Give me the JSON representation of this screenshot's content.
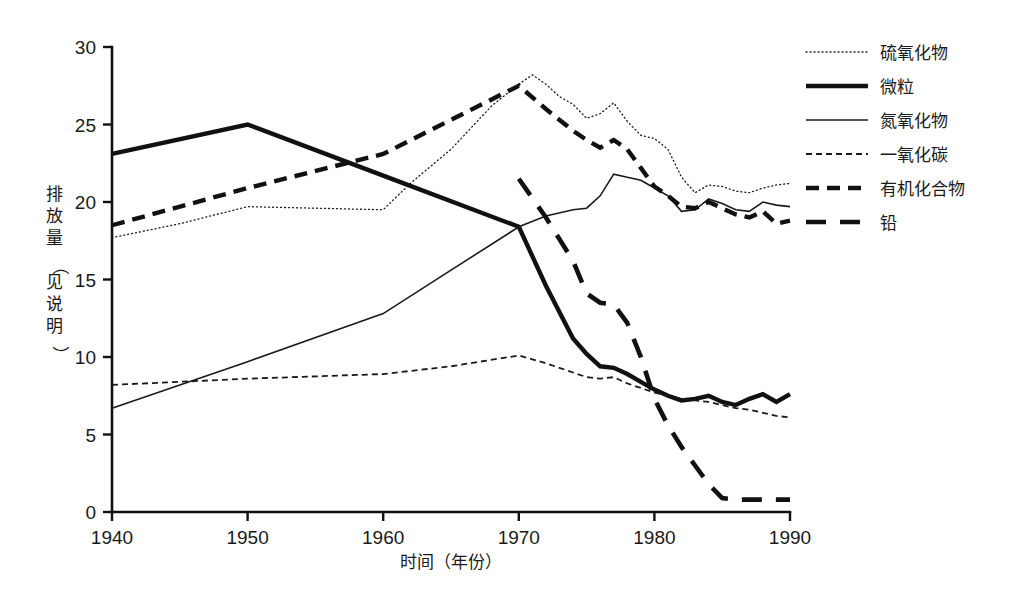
{
  "chart_data": {
    "type": "line",
    "title": "",
    "xlabel": "时间（年份）",
    "ylabel": "排放量（见说明）",
    "xlim": [
      1940,
      1990
    ],
    "ylim": [
      0,
      30
    ],
    "xticks": [
      1940,
      1950,
      1960,
      1970,
      1980,
      1990
    ],
    "xtick_labels": [
      "1940",
      "1950",
      "1960",
      "1970",
      "1980",
      "1990"
    ],
    "yticks": [
      0,
      5,
      10,
      15,
      20,
      25,
      30
    ],
    "ytick_labels": [
      "0",
      "5",
      "10",
      "15",
      "20",
      "25",
      "30"
    ],
    "grid": false,
    "legend_position": "right",
    "series": [
      {
        "name": "硫氧化物",
        "style": "dotted-thin",
        "color": "#1a1a1a",
        "width": 1.3,
        "dash": "1,3",
        "x": [
          1940,
          1945,
          1950,
          1955,
          1960,
          1962,
          1965,
          1968,
          1970,
          1971,
          1972,
          1973,
          1974,
          1975,
          1976,
          1977,
          1978,
          1979,
          1980,
          1981,
          1982,
          1983,
          1984,
          1985,
          1986,
          1987,
          1988,
          1989,
          1990
        ],
        "y": [
          17.7,
          18.6,
          19.7,
          19.6,
          19.5,
          21.2,
          23.4,
          26.2,
          27.6,
          28.2,
          27.6,
          26.8,
          26.3,
          25.4,
          25.7,
          26.4,
          25.2,
          24.3,
          24.1,
          23.4,
          21.6,
          20.6,
          21.1,
          21.0,
          20.7,
          20.6,
          20.9,
          21.1,
          21.2
        ]
      },
      {
        "name": "微粒",
        "style": "solid-thick",
        "color": "#111111",
        "width": 4.4,
        "dash": "",
        "x": [
          1940,
          1950,
          1960,
          1970,
          1972,
          1974,
          1975,
          1976,
          1977,
          1978,
          1979,
          1980,
          1981,
          1982,
          1983,
          1984,
          1985,
          1986,
          1987,
          1988,
          1989,
          1990
        ],
        "y": [
          23.1,
          25.0,
          21.7,
          18.4,
          14.6,
          11.2,
          10.2,
          9.4,
          9.3,
          8.9,
          8.4,
          7.9,
          7.5,
          7.2,
          7.3,
          7.5,
          7.1,
          6.9,
          7.3,
          7.6,
          7.1,
          7.6
        ]
      },
      {
        "name": "氮氧化物",
        "style": "solid-thin",
        "color": "#1a1a1a",
        "width": 1.6,
        "dash": "",
        "x": [
          1940,
          1950,
          1960,
          1965,
          1970,
          1972,
          1974,
          1975,
          1976,
          1977,
          1978,
          1979,
          1980,
          1981,
          1982,
          1983,
          1984,
          1985,
          1986,
          1987,
          1988,
          1989,
          1990
        ],
        "y": [
          6.7,
          9.7,
          12.8,
          15.6,
          18.4,
          19.1,
          19.5,
          19.6,
          20.4,
          21.8,
          21.6,
          21.4,
          20.9,
          20.4,
          19.4,
          19.5,
          20.2,
          19.9,
          19.5,
          19.4,
          20.0,
          19.8,
          19.7
        ]
      },
      {
        "name": "一氧化碳",
        "style": "dashed-thin",
        "color": "#1a1a1a",
        "width": 1.8,
        "dash": "6,4",
        "x": [
          1940,
          1950,
          1960,
          1965,
          1970,
          1972,
          1974,
          1975,
          1976,
          1977,
          1978,
          1979,
          1980,
          1981,
          1982,
          1983,
          1984,
          1985,
          1986,
          1987,
          1988,
          1989,
          1990
        ],
        "y": [
          8.2,
          8.6,
          8.9,
          9.4,
          10.1,
          9.6,
          9.0,
          8.7,
          8.6,
          8.7,
          8.3,
          8.0,
          7.7,
          7.5,
          7.3,
          7.2,
          7.1,
          6.9,
          6.7,
          6.6,
          6.4,
          6.2,
          6.1
        ]
      },
      {
        "name": "有机化合物",
        "style": "dashed-thick",
        "color": "#111111",
        "width": 4.4,
        "dash": "13,8",
        "x": [
          1940,
          1950,
          1960,
          1970,
          1972,
          1974,
          1975,
          1976,
          1977,
          1978,
          1979,
          1980,
          1981,
          1982,
          1983,
          1984,
          1985,
          1986,
          1987,
          1988,
          1989,
          1990
        ],
        "y": [
          18.5,
          20.9,
          23.1,
          27.5,
          26.0,
          24.6,
          24.0,
          23.5,
          24.0,
          23.4,
          22.2,
          21.0,
          20.4,
          19.7,
          19.6,
          20.0,
          19.6,
          19.2,
          19.0,
          19.4,
          18.6,
          18.8
        ]
      },
      {
        "name": "铅",
        "style": "dashed-long-thick",
        "color": "#111111",
        "width": 4.6,
        "dash": "20,14",
        "x": [
          1970,
          1972,
          1974,
          1975,
          1976,
          1977,
          1978,
          1979,
          1980,
          1981,
          1982,
          1983,
          1984,
          1985,
          1986,
          1987,
          1988,
          1989,
          1990
        ],
        "y": [
          21.5,
          19.0,
          16.2,
          14.1,
          13.5,
          13.4,
          12.2,
          10.0,
          7.3,
          5.6,
          4.2,
          3.0,
          1.8,
          0.9,
          0.8,
          0.8,
          0.8,
          0.8,
          0.8
        ]
      }
    ]
  },
  "legend": {
    "items": [
      {
        "label": "硫氧化物"
      },
      {
        "label": "微粒"
      },
      {
        "label": "氮氧化物"
      },
      {
        "label": "一氧化碳"
      },
      {
        "label": "有机化合物"
      },
      {
        "label": "铅"
      }
    ]
  }
}
